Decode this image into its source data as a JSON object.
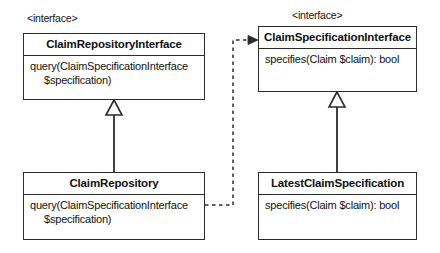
{
  "diagram": {
    "type": "uml-class-diagram",
    "width": 440,
    "height": 253,
    "colors": {
      "background": "#ffffff",
      "stroke": "#2b2b2b",
      "text": "#101010"
    }
  },
  "stereotypes": {
    "repository_interface": "<interface>",
    "specification_interface": "<interface>"
  },
  "classes": [
    {
      "id": "claim-repository-interface",
      "name": "ClaimRepositoryInterface",
      "stereotype": "<interface>",
      "members": [
        "query(ClaimSpecificationInterface",
        "$specification)"
      ]
    },
    {
      "id": "claim-specification-interface",
      "name": "ClaimSpecificationInterface",
      "stereotype": "<interface>",
      "members": [
        "specifies(Claim $claim): bool"
      ]
    },
    {
      "id": "claim-repository",
      "name": "ClaimRepository",
      "stereotype": "",
      "members": [
        "query(ClaimSpecificationInterface",
        "$specification)"
      ]
    },
    {
      "id": "latest-claim-specification",
      "name": "LatestClaimSpecification",
      "stereotype": "",
      "members": [
        "specifies(Claim $claim): bool"
      ]
    }
  ],
  "relationships": [
    {
      "id": "realization-repository",
      "kind": "realization",
      "from": "ClaimRepository",
      "to": "ClaimRepositoryInterface",
      "line": "solid",
      "arrow": "hollow-triangle"
    },
    {
      "id": "realization-specification",
      "kind": "realization",
      "from": "LatestClaimSpecification",
      "to": "ClaimSpecificationInterface",
      "line": "solid",
      "arrow": "hollow-triangle"
    },
    {
      "id": "dependency-repository-to-specification",
      "kind": "dependency",
      "from": "ClaimRepository",
      "to": "ClaimSpecificationInterface",
      "line": "dashed",
      "arrow": "open-arrow"
    }
  ]
}
